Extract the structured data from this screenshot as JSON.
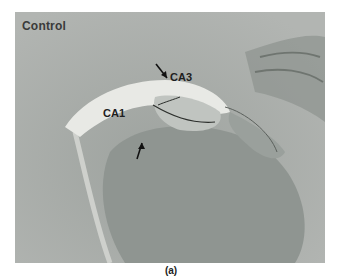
{
  "figure": {
    "panel_label": "Control",
    "regions": [
      {
        "name": "CA3",
        "x": 170,
        "y": 70
      },
      {
        "name": "CA1",
        "x": 88,
        "y": 98
      }
    ],
    "arrows": 2,
    "caption": "(a)"
  }
}
